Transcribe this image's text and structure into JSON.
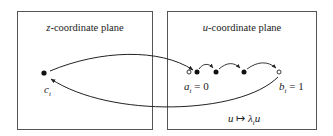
{
  "planes": {
    "z": {
      "var": "z",
      "title_suffix": "-coordinate plane"
    },
    "u": {
      "var": "u",
      "title_suffix": "-coordinate plane"
    }
  },
  "points": {
    "c": {
      "base": "c",
      "sub": "t",
      "kind": "filled"
    },
    "a": {
      "base": "a",
      "sub": "t",
      "eq": " = 0",
      "kind": "open"
    },
    "b": {
      "base": "b",
      "sub": "t",
      "eq": " = 1",
      "kind": "open"
    },
    "orbit_dots": 3
  },
  "map_label": {
    "left": "u",
    "arrow": " ↦ ",
    "lambda": "λ",
    "sub": "t",
    "right": "u"
  },
  "colors": {
    "stroke": "#222222",
    "border": "#555555"
  }
}
